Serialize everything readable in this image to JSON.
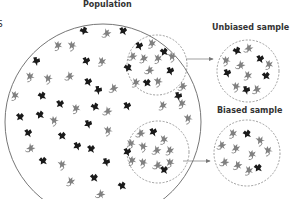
{
  "labels": {
    "population": "Population",
    "unbiased": "Unbiased sample",
    "biased": "Biased sample",
    "edge_fragment": "S"
  },
  "colors": {
    "dark_animal": "#1a1a1a",
    "light_animal": "#808080",
    "circle_stroke": "#666666",
    "dashed_stroke": "#777777",
    "arrow": "#777777"
  },
  "circles": {
    "population": {
      "cx": 103,
      "cy": 122,
      "r": 98
    },
    "unbiased_selection": {
      "cx": 157,
      "cy": 65,
      "r": 30
    },
    "biased_selection": {
      "cx": 158,
      "cy": 152,
      "r": 31
    },
    "unbiased_sample": {
      "cx": 248,
      "cy": 71,
      "r": 31
    },
    "biased_sample": {
      "cx": 247,
      "cy": 153,
      "r": 33
    }
  },
  "animals": {
    "population": [
      {
        "x": 84,
        "y": 31,
        "t": "d"
      },
      {
        "x": 107,
        "y": 33,
        "t": "l"
      },
      {
        "x": 123,
        "y": 31,
        "t": "d"
      },
      {
        "x": 58,
        "y": 45,
        "t": "l"
      },
      {
        "x": 72,
        "y": 45,
        "t": "l"
      },
      {
        "x": 36,
        "y": 61,
        "t": "d"
      },
      {
        "x": 86,
        "y": 61,
        "t": "d"
      },
      {
        "x": 102,
        "y": 61,
        "t": "l"
      },
      {
        "x": 30,
        "y": 76,
        "t": "l"
      },
      {
        "x": 48,
        "y": 78,
        "t": "l"
      },
      {
        "x": 70,
        "y": 76,
        "t": "l"
      },
      {
        "x": 88,
        "y": 82,
        "t": "d"
      },
      {
        "x": 15,
        "y": 95,
        "t": "l"
      },
      {
        "x": 42,
        "y": 96,
        "t": "d"
      },
      {
        "x": 98,
        "y": 90,
        "t": "d"
      },
      {
        "x": 114,
        "y": 88,
        "t": "l"
      },
      {
        "x": 60,
        "y": 104,
        "t": "d"
      },
      {
        "x": 76,
        "y": 108,
        "t": "l"
      },
      {
        "x": 95,
        "y": 107,
        "t": "d"
      },
      {
        "x": 108,
        "y": 111,
        "t": "l"
      },
      {
        "x": 127,
        "y": 106,
        "t": "d"
      },
      {
        "x": 20,
        "y": 117,
        "t": "d"
      },
      {
        "x": 40,
        "y": 115,
        "t": "d"
      },
      {
        "x": 54,
        "y": 120,
        "t": "l"
      },
      {
        "x": 88,
        "y": 124,
        "t": "d"
      },
      {
        "x": 28,
        "y": 133,
        "t": "d"
      },
      {
        "x": 62,
        "y": 136,
        "t": "d"
      },
      {
        "x": 108,
        "y": 130,
        "t": "l"
      },
      {
        "x": 31,
        "y": 148,
        "t": "l"
      },
      {
        "x": 77,
        "y": 146,
        "t": "d"
      },
      {
        "x": 91,
        "y": 149,
        "t": "d"
      },
      {
        "x": 43,
        "y": 161,
        "t": "d"
      },
      {
        "x": 62,
        "y": 164,
        "t": "l"
      },
      {
        "x": 106,
        "y": 162,
        "t": "d"
      },
      {
        "x": 71,
        "y": 181,
        "t": "l"
      },
      {
        "x": 94,
        "y": 178,
        "t": "d"
      },
      {
        "x": 122,
        "y": 186,
        "t": "d"
      },
      {
        "x": 101,
        "y": 194,
        "t": "l"
      },
      {
        "x": 183,
        "y": 86,
        "t": "l"
      },
      {
        "x": 163,
        "y": 105,
        "t": "l"
      },
      {
        "x": 182,
        "y": 103,
        "t": "l"
      },
      {
        "x": 188,
        "y": 118,
        "t": "l"
      },
      {
        "x": 178,
        "y": 96,
        "t": "d"
      }
    ],
    "unbiased_selection": [
      {
        "x": 139,
        "y": 46,
        "t": "d"
      },
      {
        "x": 152,
        "y": 43,
        "t": "l"
      },
      {
        "x": 164,
        "y": 52,
        "t": "d"
      },
      {
        "x": 172,
        "y": 56,
        "t": "l"
      },
      {
        "x": 133,
        "y": 56,
        "t": "l"
      },
      {
        "x": 144,
        "y": 58,
        "t": "l"
      },
      {
        "x": 158,
        "y": 58,
        "t": "l"
      },
      {
        "x": 128,
        "y": 68,
        "t": "d"
      },
      {
        "x": 150,
        "y": 70,
        "t": "l"
      },
      {
        "x": 170,
        "y": 71,
        "t": "d"
      },
      {
        "x": 136,
        "y": 82,
        "t": "l"
      },
      {
        "x": 147,
        "y": 83,
        "t": "d"
      },
      {
        "x": 158,
        "y": 81,
        "t": "l"
      }
    ],
    "biased_selection": [
      {
        "x": 141,
        "y": 133,
        "t": "l"
      },
      {
        "x": 153,
        "y": 132,
        "t": "d"
      },
      {
        "x": 164,
        "y": 139,
        "t": "l"
      },
      {
        "x": 131,
        "y": 143,
        "t": "l"
      },
      {
        "x": 143,
        "y": 146,
        "t": "l"
      },
      {
        "x": 157,
        "y": 150,
        "t": "l"
      },
      {
        "x": 170,
        "y": 150,
        "t": "l"
      },
      {
        "x": 132,
        "y": 160,
        "t": "l"
      },
      {
        "x": 143,
        "y": 162,
        "t": "l"
      },
      {
        "x": 158,
        "y": 165,
        "t": "l"
      },
      {
        "x": 127,
        "y": 152,
        "t": "d"
      },
      {
        "x": 164,
        "y": 170,
        "t": "d"
      },
      {
        "x": 170,
        "y": 162,
        "t": "l"
      }
    ],
    "unbiased_sample": [
      {
        "x": 237,
        "y": 51,
        "t": "d"
      },
      {
        "x": 249,
        "y": 48,
        "t": "l"
      },
      {
        "x": 260,
        "y": 59,
        "t": "d"
      },
      {
        "x": 269,
        "y": 64,
        "t": "l"
      },
      {
        "x": 226,
        "y": 60,
        "t": "l"
      },
      {
        "x": 241,
        "y": 65,
        "t": "l"
      },
      {
        "x": 227,
        "y": 73,
        "t": "d"
      },
      {
        "x": 248,
        "y": 75,
        "t": "l"
      },
      {
        "x": 266,
        "y": 76,
        "t": "d"
      },
      {
        "x": 236,
        "y": 86,
        "t": "l"
      },
      {
        "x": 246,
        "y": 90,
        "t": "d"
      },
      {
        "x": 257,
        "y": 89,
        "t": "l"
      }
    ],
    "biased_sample": [
      {
        "x": 233,
        "y": 133,
        "t": "l"
      },
      {
        "x": 247,
        "y": 134,
        "t": "d"
      },
      {
        "x": 260,
        "y": 140,
        "t": "l"
      },
      {
        "x": 222,
        "y": 145,
        "t": "l"
      },
      {
        "x": 236,
        "y": 148,
        "t": "l"
      },
      {
        "x": 252,
        "y": 154,
        "t": "l"
      },
      {
        "x": 268,
        "y": 150,
        "t": "l"
      },
      {
        "x": 225,
        "y": 162,
        "t": "l"
      },
      {
        "x": 238,
        "y": 165,
        "t": "l"
      },
      {
        "x": 249,
        "y": 170,
        "t": "l"
      },
      {
        "x": 258,
        "y": 168,
        "t": "d"
      }
    ]
  }
}
